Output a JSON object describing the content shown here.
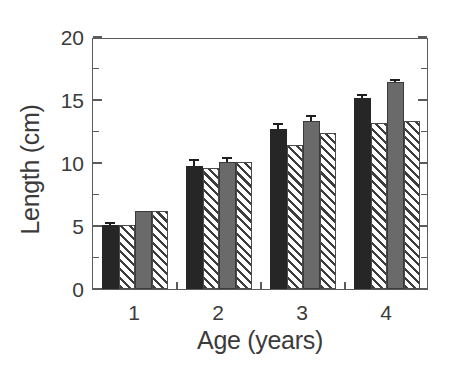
{
  "chart_data": {
    "type": "bar",
    "title": "",
    "subtitle": "",
    "xlabel": "Age (years)",
    "ylabel": "Length (cm)",
    "categories": [
      "1",
      "2",
      "3",
      "4"
    ],
    "xtick_labels": [
      "1",
      "2",
      "3",
      "4"
    ],
    "ytick_labels": [
      "0",
      "5",
      "10",
      "15",
      "20"
    ],
    "ytick_values": [
      0,
      5,
      10,
      15,
      20
    ],
    "yminor_values": [
      2.5,
      7.5,
      12.5,
      17.5
    ],
    "ylim": [
      0,
      20
    ],
    "grid": false,
    "legend": "none",
    "legend_position": "none",
    "series": [
      {
        "name": "series-1",
        "style": "solid-dark",
        "color": "#262626",
        "values": [
          5.05,
          9.75,
          12.7,
          15.15
        ],
        "errors": [
          0.25,
          0.55,
          0.5,
          0.3
        ]
      },
      {
        "name": "series-2",
        "style": "hatch",
        "color": "#ffffff",
        "values": [
          5.05,
          9.6,
          11.4,
          13.15
        ],
        "errors": [
          0,
          0,
          0,
          0
        ]
      },
      {
        "name": "series-3",
        "style": "solid-gray",
        "color": "#6a6a6a",
        "values": [
          6.2,
          10.05,
          13.35,
          16.4
        ],
        "errors": [
          0,
          0.45,
          0.45,
          0.3
        ]
      },
      {
        "name": "series-4",
        "style": "hatch",
        "color": "#ffffff",
        "values": [
          6.2,
          10.1,
          12.35,
          13.35
        ],
        "errors": [
          0,
          0,
          0,
          0
        ]
      }
    ]
  },
  "axes": {
    "y_title": "Length (cm)",
    "x_title": "Age (years)"
  }
}
